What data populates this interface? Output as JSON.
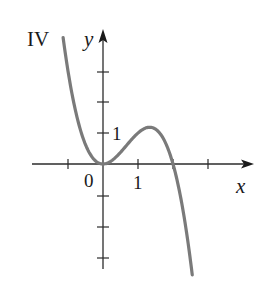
{
  "panel_label": "IV",
  "axes": {
    "x_label": "x",
    "y_label": "y",
    "origin_label": "0",
    "x_tick_label": "1",
    "y_tick_label": "1"
  },
  "colors": {
    "axis": "#2b2b2b",
    "curve": "#7a7a7a",
    "text": "#1a1a1a",
    "background": "#ffffff"
  },
  "chart_data": {
    "type": "line",
    "title": "IV",
    "xlabel": "x",
    "ylabel": "y",
    "function": "y = x^2 (2 - x)",
    "x_ticks": [
      -1,
      1,
      2,
      3
    ],
    "y_ticks": [
      -3,
      -2,
      -1,
      1,
      2,
      3
    ],
    "labeled_ticks": {
      "x": [
        "0",
        "1"
      ],
      "y": [
        "1"
      ]
    },
    "xlim": [
      -2.0,
      4.3
    ],
    "ylim": [
      -3.4,
      4.4
    ],
    "grid": false,
    "legend": null,
    "key_points": [
      {
        "x": 0,
        "y": 0,
        "note": "local minimum"
      },
      {
        "x": 1.33,
        "y": 1.19,
        "note": "local maximum"
      },
      {
        "x": 2,
        "y": 0,
        "note": "x-intercept"
      }
    ],
    "series": [
      {
        "name": "curve IV",
        "x": [
          -1.14,
          -1.0,
          -0.75,
          -0.5,
          -0.25,
          0,
          0.25,
          0.5,
          0.75,
          1.0,
          1.25,
          1.33,
          1.5,
          1.75,
          2.0,
          2.25,
          2.4,
          2.55
        ],
        "y": [
          4.08,
          3.0,
          1.55,
          0.63,
          0.14,
          0,
          0.11,
          0.38,
          0.7,
          1.0,
          1.17,
          1.19,
          1.13,
          0.77,
          0,
          -1.27,
          -2.3,
          -3.58
        ]
      }
    ]
  }
}
